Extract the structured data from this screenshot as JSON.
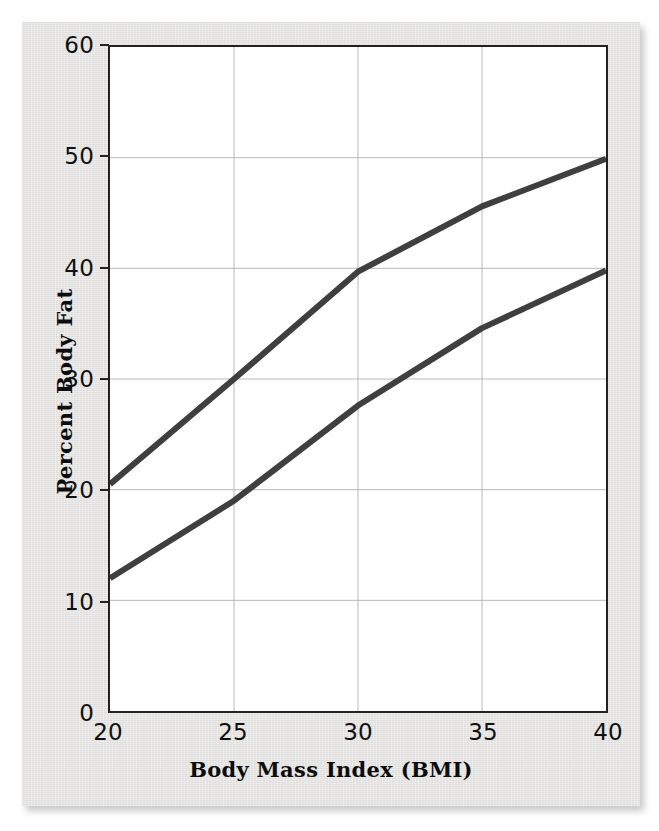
{
  "chart_data": {
    "type": "line",
    "title": "",
    "xlabel": "Body Mass Index (BMI)",
    "ylabel": "Percent Body Fat",
    "xlim": [
      20,
      40
    ],
    "ylim": [
      0,
      60
    ],
    "xticks": [
      "20",
      "25",
      "30",
      "35",
      "40"
    ],
    "yticks": [
      "0",
      "10",
      "20",
      "30",
      "40",
      "50",
      "60"
    ],
    "xtick_values": [
      20,
      25,
      30,
      35,
      40
    ],
    "ytick_values": [
      0,
      10,
      20,
      30,
      40,
      50,
      60
    ],
    "grid": true,
    "grid_color": "#b9b9b9",
    "legend": "none",
    "line_color": "#3f3f3f",
    "line_width": 6,
    "x": [
      20,
      25,
      30,
      35,
      40
    ],
    "series": [
      {
        "name": "upper-curve",
        "values": [
          20.5,
          30.0,
          39.7,
          45.6,
          49.9
        ]
      },
      {
        "name": "lower-curve",
        "values": [
          12.0,
          19.0,
          27.6,
          34.6,
          39.8
        ]
      }
    ]
  },
  "axes": {
    "x_title": "Body Mass Index (BMI)",
    "y_title": "Percent Body Fat"
  },
  "ticks": {
    "x": [
      "20",
      "25",
      "30",
      "35",
      "40"
    ],
    "y": [
      "0",
      "10",
      "20",
      "30",
      "40",
      "50",
      "60"
    ]
  }
}
